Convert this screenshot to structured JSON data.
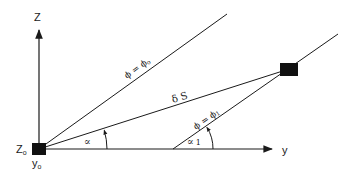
{
  "diagram": {
    "type": "geometry",
    "axes": {
      "vertical": {
        "label": "Z"
      },
      "horizontal": {
        "label": "y"
      }
    },
    "origin": {
      "label_z": "Z",
      "label_z_sub": "o",
      "label_y": "y",
      "label_y_sub": "o"
    },
    "lines": [
      {
        "id": "phi0",
        "label": "ϕ = ϕ",
        "label_sub": "o"
      },
      {
        "id": "ds",
        "label": "δ S"
      },
      {
        "id": "phi1",
        "label": "ϕ = ϕ",
        "label_sub": "1"
      }
    ],
    "angles": [
      {
        "id": "alpha",
        "label": "∝"
      },
      {
        "id": "alpha1",
        "label": "∝",
        "label_sub": "1"
      }
    ],
    "colors": {
      "stroke": "#1a1a1a",
      "marker": "#111111",
      "background": "#ffffff"
    }
  }
}
